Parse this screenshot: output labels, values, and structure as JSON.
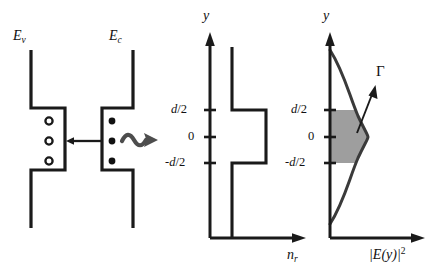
{
  "figure": {
    "background": "#ffffff",
    "line_color": "#1a1a1a",
    "shade_color": "#9e9e9e",
    "squiggle_color": "#4d4d4d",
    "width": 439,
    "height": 276
  },
  "band_panel": {
    "name": "band-diagram",
    "valence_label": "E",
    "valence_sub": "v",
    "conduction_label": "E",
    "conduction_sub": "c",
    "hole_count": 3,
    "electron_count": 3,
    "carrier_arrow": "left-arrow",
    "photon_arrow": "squiggly-right-arrow"
  },
  "index_panel": {
    "name": "refractive-index-profile",
    "y_axis_label": "y",
    "x_axis_label": "n",
    "x_axis_sub": "r",
    "ticks": [
      {
        "label": "d/2",
        "italic_part": "d",
        "plain_part": "/2"
      },
      {
        "label": "0",
        "italic_part": "",
        "plain_part": "0"
      },
      {
        "label": "-d/2",
        "italic_part": "d",
        "plain_part": "/2"
      }
    ],
    "tick_top": "d/2",
    "tick_mid": "0",
    "tick_bottom": "-d/2",
    "step_description": "higher refractive index between -d/2 and d/2"
  },
  "intensity_panel": {
    "name": "optical-intensity-profile",
    "y_axis_label": "y",
    "x_axis_label": "|E(y)|",
    "x_axis_sup": "2",
    "confinement_symbol": "Γ",
    "tick_top": "d/2",
    "tick_mid": "0",
    "tick_bottom": "-d/2",
    "curve_type": "gaussian-mode-profile",
    "shaded_region": "confinement factor area between -d/2 and d/2"
  },
  "chart_data": {
    "type": "line",
    "panels": [
      {
        "name": "refractive_index",
        "xlabel": "n_r",
        "ylabel": "y",
        "yticks": [
          "d/2",
          "0",
          "-d/2"
        ],
        "ytick_values": [
          0.5,
          0,
          -0.5
        ],
        "x": [
          1,
          1,
          1.55,
          1.55,
          1
        ],
        "y": [
          1.6,
          0.5,
          0.5,
          -0.5,
          -0.5
        ],
        "grid": false,
        "legend": "none"
      },
      {
        "name": "mode_intensity",
        "xlabel": "|E(y)|^2",
        "ylabel": "y",
        "yticks": [
          "d/2",
          "0",
          "-d/2"
        ],
        "ytick_values": [
          0.5,
          0,
          -0.5
        ],
        "annotation": "Γ",
        "curve": "gaussian centered at y=0",
        "shaded_y_range": [
          -0.5,
          0.5
        ],
        "grid": false,
        "legend": "none"
      }
    ]
  }
}
